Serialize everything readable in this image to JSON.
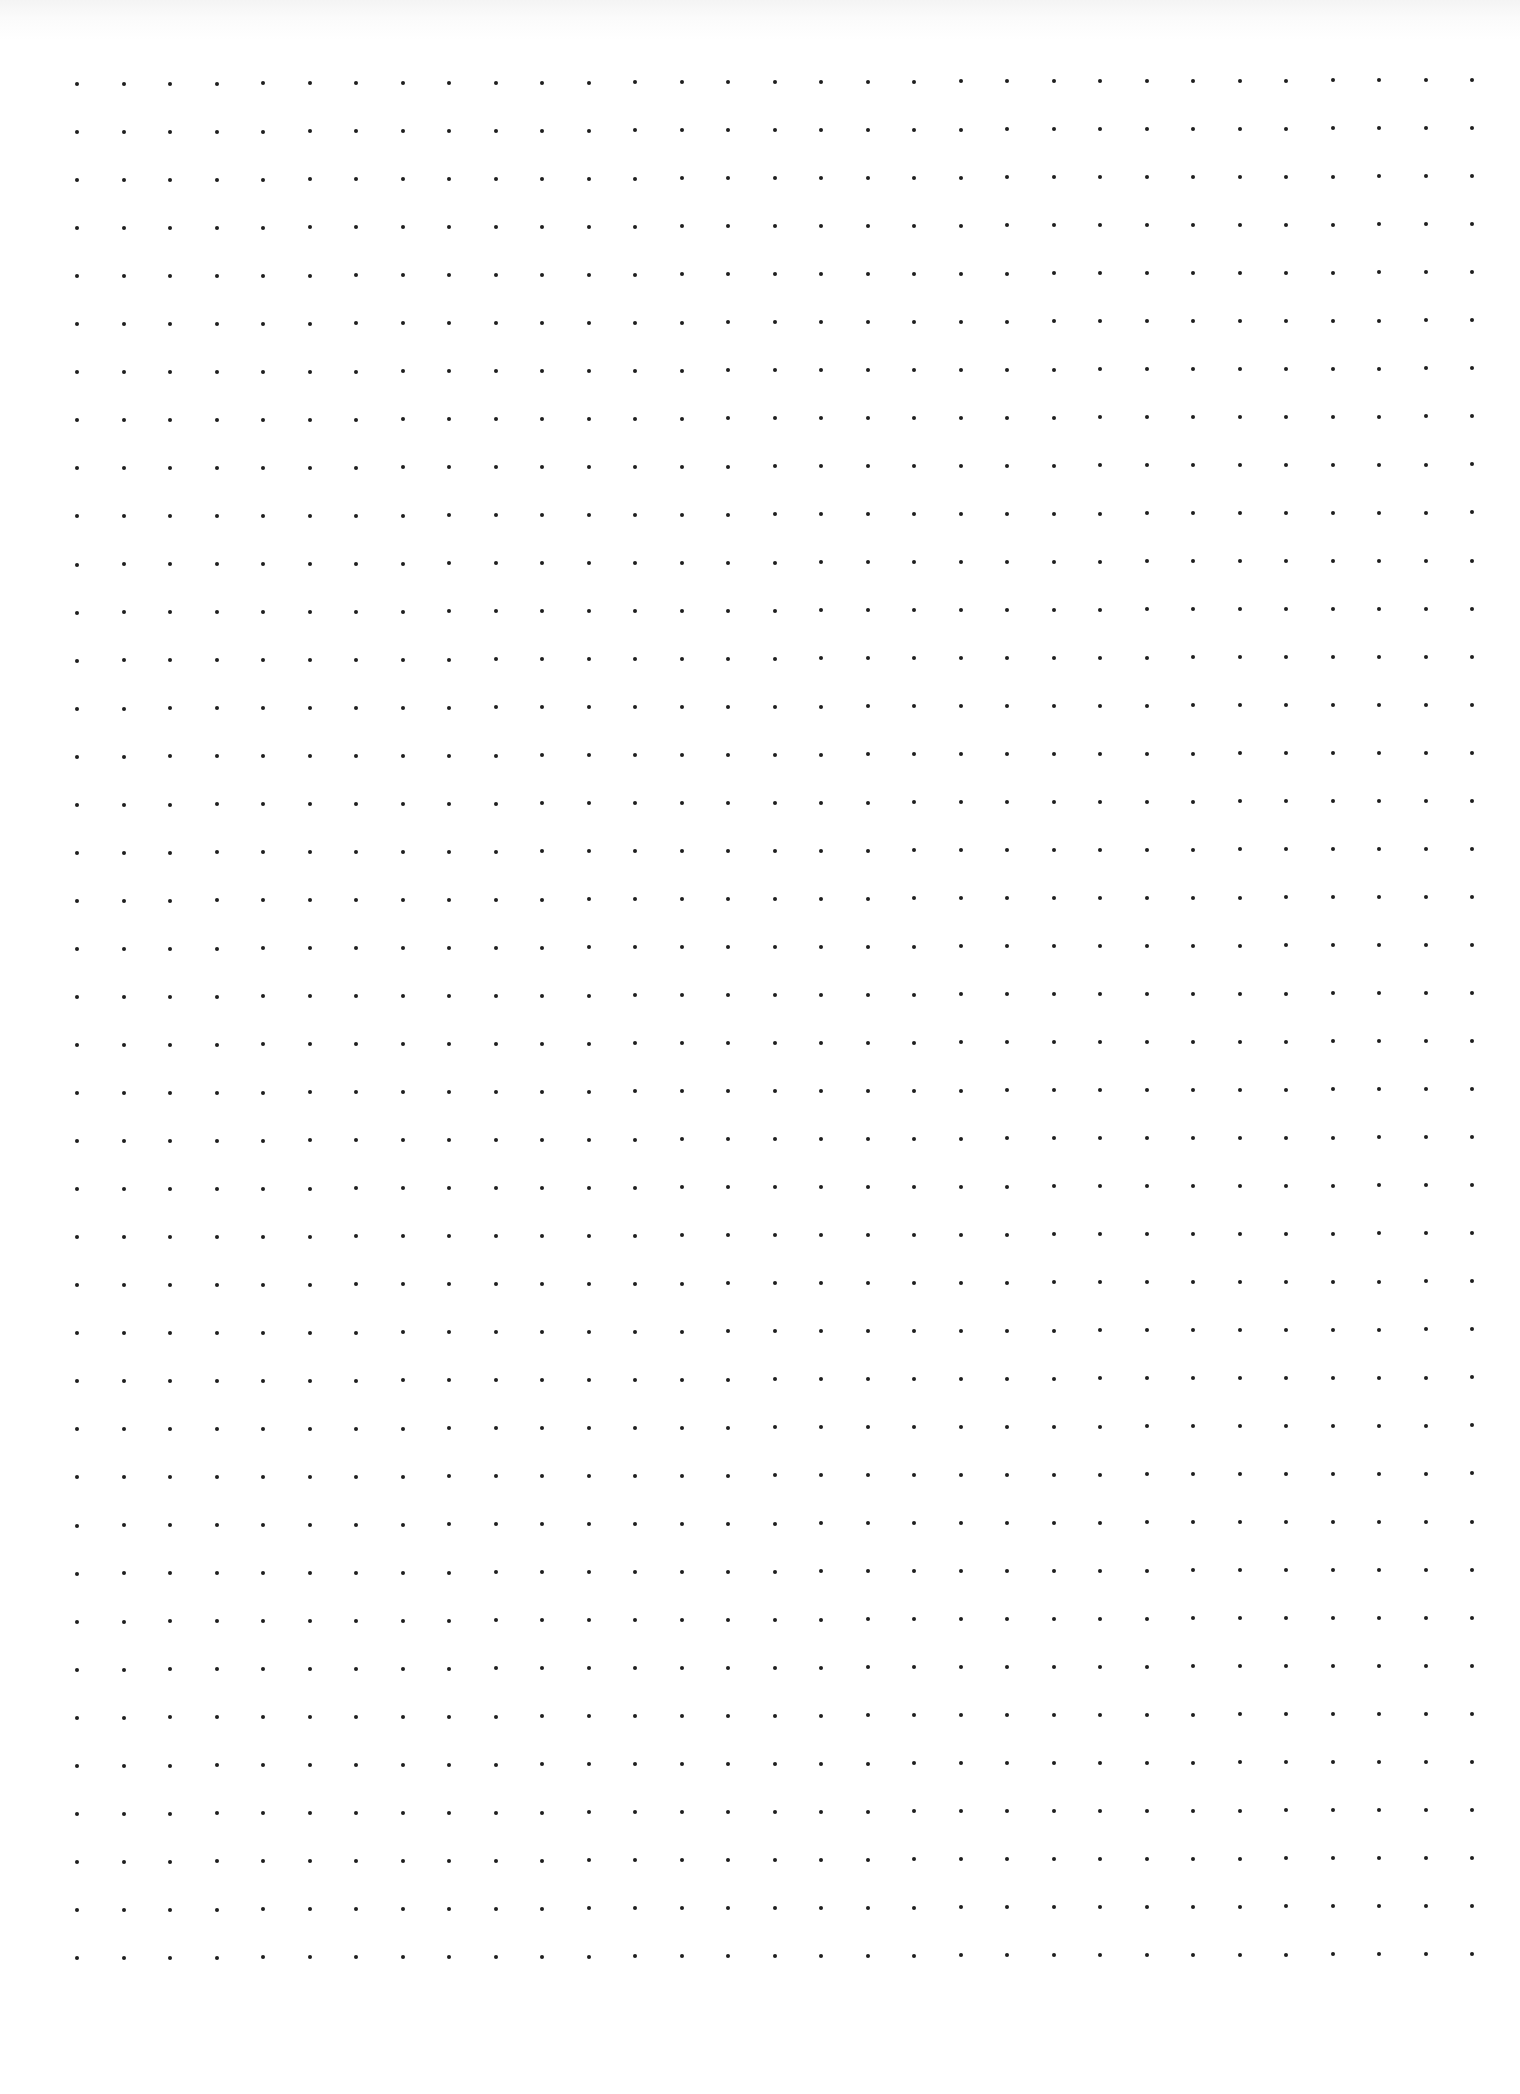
{
  "page": {
    "type": "dot-grid-paper",
    "background_color": "#ffffff",
    "dot_color": "#1e1e1e"
  },
  "grid": {
    "columns": 31,
    "rows": 40,
    "origin_x": 77,
    "origin_y": 84,
    "spacing_x": 46.5,
    "spacing_y": 48,
    "dot_diameter": 4
  }
}
